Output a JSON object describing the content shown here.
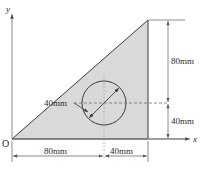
{
  "figure": {
    "axes": {
      "x_label": "x",
      "y_label": "y",
      "origin_label": "O"
    },
    "dimensions": {
      "bottom_left": "80mm",
      "bottom_right": "40mm",
      "right_upper": "80mm",
      "right_lower": "40mm",
      "circle_diameter": "40mm"
    },
    "colors": {
      "fill": "#d9d9d9",
      "outline": "#3a3a3a",
      "dimension": "#5a5a5a",
      "centerline": "#9a9a9a",
      "background": "#ffffff"
    },
    "geometry": {
      "triangle_vertices": "origin, base-right, apex-top-right",
      "base_total_mm": 120,
      "height_total_mm": 120,
      "circle_center_x_mm": 80,
      "circle_center_y_mm": 40,
      "circle_diameter_mm": 40
    }
  }
}
